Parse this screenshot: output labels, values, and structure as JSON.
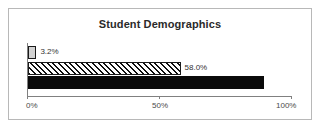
{
  "chart_data": {
    "type": "bar",
    "orientation": "horizontal",
    "title": "Student Demographics",
    "xlabel": "",
    "ylabel": "",
    "xlim": [
      0,
      100
    ],
    "grid": false,
    "legend": null,
    "categories": [
      "series-1",
      "series-2",
      "series-3"
    ],
    "values": [
      3.2,
      89.7,
      58.0
    ],
    "bars": [
      {
        "value": 3.2,
        "label": "3.2%",
        "style": "gray",
        "label_position": "outside"
      },
      {
        "value": 58.0,
        "label": "58.0%",
        "style": "hatch",
        "label_position": "outside"
      },
      {
        "value": 89.7,
        "label": "89.7%",
        "style": "solid",
        "label_position": "inside"
      }
    ],
    "xticks": [
      0,
      50,
      100
    ],
    "xticklabels": [
      "0%",
      "50%",
      "100%"
    ]
  },
  "colors": {
    "frame_border": "#b8b8b8",
    "axis": "#808080",
    "bar_gray": "#d2d2d2",
    "bar_hatch_line": "#111111",
    "bar_solid": "#0a0a0a",
    "title_text": "#2a2a2a",
    "label_text": "#333333",
    "inside_label_text": "#ffffff",
    "background": "#ffffff"
  }
}
